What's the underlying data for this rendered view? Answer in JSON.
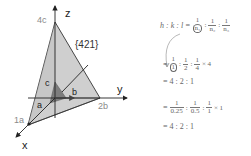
{
  "diagram": {
    "plane_label": "{421}",
    "axes": {
      "x": "x",
      "y": "y",
      "z": "z"
    },
    "intercepts": {
      "x": "1a",
      "y": "2b",
      "z": "4c"
    },
    "unit_vectors": {
      "a": "a",
      "b": "b",
      "c": "c"
    },
    "colors": {
      "plane_fill": "#c8c8c8",
      "plane_edge": "#333333",
      "unit_cell_fill": "#808080",
      "axis": "#222222",
      "intercept_label": "#8a8a8a"
    }
  },
  "formula": {
    "line1": {
      "lhs": "h : k : l =",
      "fractions": [
        {
          "num": "1",
          "den": "n₁"
        },
        {
          "num": "1",
          "den": "n₂"
        },
        {
          "num": "1",
          "den": "n₃"
        }
      ]
    },
    "line2": {
      "prefix": "=",
      "fractions": [
        {
          "num": "1",
          "den": "1"
        },
        {
          "num": "1",
          "den": "2"
        },
        {
          "num": "1",
          "den": "4"
        }
      ],
      "suffix": "× 4"
    },
    "line3": "= 4 : 2 : 1",
    "line4": {
      "prefix": "=",
      "fractions": [
        {
          "num": "1",
          "den": "0.25"
        },
        {
          "num": "1",
          "den": "0.5"
        },
        {
          "num": "1",
          "den": "1"
        }
      ],
      "suffix": "× 1"
    },
    "line5": "= 4 : 2 : 1",
    "separator": ":"
  }
}
